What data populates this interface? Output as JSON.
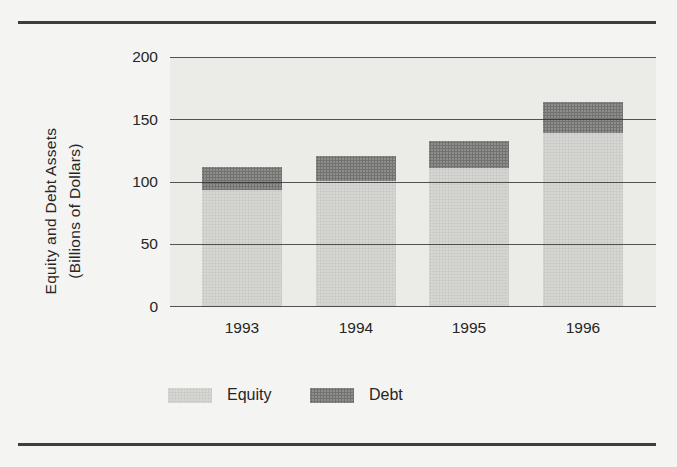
{
  "figure": {
    "background": "#f4f4f2",
    "panel_background": "#ebece8",
    "rule_color": "#3d3d3d",
    "gridline_color": "#303030",
    "text_color": "#262626"
  },
  "y_axis": {
    "label_line1": "Equity and Debt Assets",
    "label_line2": "(Billions of Dollars)",
    "ticks": [
      "200",
      "150",
      "100",
      "50",
      "0"
    ]
  },
  "chart_data": {
    "type": "bar",
    "stacked": true,
    "title": "",
    "xlabel": "",
    "ylabel": "Equity and Debt Assets (Billions of Dollars)",
    "categories": [
      "1993",
      "1994",
      "1995",
      "1996"
    ],
    "series": [
      {
        "name": "Equity",
        "color": "#d7d8d4",
        "values": [
          94,
          101,
          111,
          139
        ]
      },
      {
        "name": "Debt",
        "color": "#8e8e8c",
        "values": [
          18,
          20,
          22,
          25
        ]
      }
    ],
    "stacked_totals": [
      112,
      121,
      133,
      164
    ],
    "ylim": [
      0,
      200
    ],
    "yticks": [
      0,
      50,
      100,
      150,
      200
    ],
    "grid": "horizontal",
    "legend_position": "bottom"
  }
}
